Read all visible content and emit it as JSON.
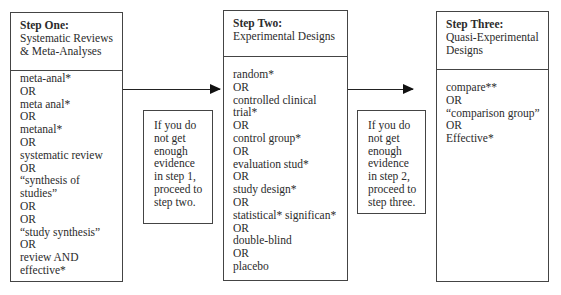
{
  "steps": [
    {
      "title": "Step One:",
      "subtitle_lines": [
        "Systematic Reviews",
        "& Meta-Analyses"
      ],
      "terms": [
        "meta-anal*",
        "OR",
        "meta anal*",
        "OR",
        "metanal*",
        "OR",
        "systematic review",
        "OR",
        "“synthesis of",
        "studies”",
        "OR",
        "OR",
        "“study synthesis”",
        "OR",
        "review AND",
        "effective*"
      ]
    },
    {
      "title": "Step Two:",
      "subtitle_lines": [
        "Experimental Designs"
      ],
      "terms": [
        "random*",
        "OR",
        "controlled clinical",
        "trial*",
        "OR",
        "control group*",
        "OR",
        "evaluation stud*",
        "OR",
        "study design*",
        "OR",
        "statistical* significan*",
        "OR",
        "double-blind",
        "OR",
        "placebo"
      ]
    },
    {
      "title": "Step Three:",
      "subtitle_lines": [
        "Quasi-Experimental",
        "Designs"
      ],
      "terms": [
        "compare**",
        "OR",
        "“comparison group”",
        "OR",
        "Effective*"
      ]
    }
  ],
  "notes": [
    {
      "lines": [
        "If you do",
        "not get",
        "enough",
        "evidence",
        "in step 1,",
        "proceed to",
        "step two."
      ]
    },
    {
      "lines": [
        "If you do",
        "not get",
        "enough",
        "evidence",
        "in step 2,",
        "proceed to",
        "step three."
      ]
    }
  ],
  "arrows": [
    {
      "from": "step-one",
      "to": "step-two"
    },
    {
      "from": "step-two",
      "to": "step-three"
    }
  ]
}
